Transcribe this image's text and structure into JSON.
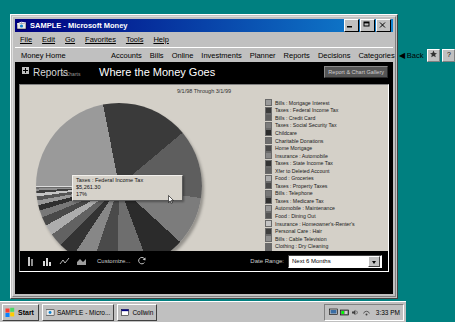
{
  "window": {
    "title": "SAMPLE - Microsoft Money",
    "icon": "money-app-icon",
    "minimize_label": "minimize-icon",
    "restore_label": "restore-icon",
    "close_label": "close-icon"
  },
  "menubar": {
    "items": [
      {
        "label": "File"
      },
      {
        "label": "Edit"
      },
      {
        "label": "Go"
      },
      {
        "label": "Favorites"
      },
      {
        "label": "Tools"
      },
      {
        "label": "Help"
      }
    ]
  },
  "navbar": {
    "home_label": "Money Home",
    "links": [
      {
        "label": "Accounts"
      },
      {
        "label": "Bills"
      },
      {
        "label": "Online"
      },
      {
        "label": "Investments"
      },
      {
        "label": "Planner"
      },
      {
        "label": "Reports"
      },
      {
        "label": "Decisions"
      },
      {
        "label": "Categories"
      }
    ],
    "back_label": "◀ Back",
    "favorites_icon": "favorites-icon",
    "help_icon": "help-icon",
    "help_label": "?"
  },
  "report_header": {
    "section_label": "Reports",
    "section_sub_label": "& Charts",
    "title": "Where the Money Goes",
    "gallery_button": "Report & Chart Gallery"
  },
  "chart_panel": {
    "date_range_caption": "9/1/98 Through 3/1/99"
  },
  "tooltip": {
    "category": "Taxes : Federal Income Tax",
    "amount": "$5,261.30",
    "percent": "17%"
  },
  "toolbar": {
    "icons": [
      {
        "name": "pie-chart-icon"
      },
      {
        "name": "bar-chart-icon"
      },
      {
        "name": "line-chart-icon"
      },
      {
        "name": "area-chart-icon"
      }
    ],
    "customize_label": "Customize...",
    "refresh_icon": "refresh-icon",
    "date_range_label": "Date Range:",
    "date_range_value": "Next 6 Months"
  },
  "taskbar": {
    "start_label": "Start",
    "tasks": [
      {
        "label": "SAMPLE - Micro...",
        "icon": "money-app-icon"
      },
      {
        "label": "Collwin",
        "icon": "window-icon"
      }
    ],
    "tray_icons": [
      "display-icon",
      "network-icon",
      "volume-icon",
      "modem-icon"
    ],
    "clock": "3:33 PM"
  },
  "chart_data": {
    "type": "pie",
    "title": "Where the Money Goes",
    "subtitle": "9/1/98 Through 3/1/99",
    "legend_position": "right",
    "highlighted_index": 1,
    "categories": [
      "Bills : Mortgage Interest",
      "Taxes : Federal Income Tax",
      "Bills : Credit Card",
      "Taxes : Social Security Tax",
      "Childcare",
      "Charitable Donations",
      "Home Mortgage",
      "Insurance : Automobile",
      "Taxes : State Income Tax",
      "Xfer to Deleted Account",
      "Food : Groceries",
      "Taxes : Property Taxes",
      "Bills : Telephone",
      "Taxes : Medicare Tax",
      "Automobile : Maintenance",
      "Food : Dining Out",
      "Insurance : Homeowner's-Renter's",
      "Personal Care : Hair",
      "Bills : Cable Television",
      "Clothing : Dry Cleaning",
      "Bills : Electricity"
    ],
    "values": [
      22.0,
      17.0,
      13.5,
      9.5,
      7.5,
      6.0,
      5.0,
      4.0,
      3.2,
      2.6,
      2.1,
      1.7,
      1.4,
      1.1,
      0.9,
      0.8,
      0.6,
      0.5,
      0.4,
      0.3,
      0.2
    ],
    "value_unit": "percent",
    "colors": [
      "#9a9a9a",
      "#3a3a3a",
      "#5e5e5e",
      "#7c7c7c",
      "#2b2b2b",
      "#6e6e6e",
      "#4a4a4a",
      "#878787",
      "#333333",
      "#626262",
      "#adadad",
      "#494949",
      "#787878",
      "#2f2f2f",
      "#999999",
      "#545454",
      "#c4c4c4",
      "#3d3d3d",
      "#8f8f8f",
      "#6a6a6a",
      "#dcdcdc"
    ]
  }
}
